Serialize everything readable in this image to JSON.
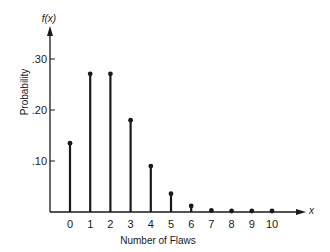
{
  "chart_data": {
    "type": "bar",
    "subtype": "stem",
    "title": "",
    "xlabel": "Number of Flaws",
    "ylabel": "Probability",
    "y_axis_symbol": "f(x)",
    "x_axis_symbol": "x",
    "categories": [
      "0",
      "1",
      "2",
      "3",
      "4",
      "5",
      "6",
      "7",
      "8",
      "9",
      "10"
    ],
    "values": [
      0.135,
      0.271,
      0.271,
      0.18,
      0.09,
      0.036,
      0.012,
      0.003,
      0.001,
      0.0002,
      4e-05
    ],
    "ylim": [
      0,
      0.33
    ],
    "yticks": [
      0.1,
      0.2,
      0.3
    ],
    "ytick_labels": [
      ".10",
      ".20",
      ".30"
    ],
    "grid": false,
    "legend": null,
    "color": "#1a1a1a"
  }
}
